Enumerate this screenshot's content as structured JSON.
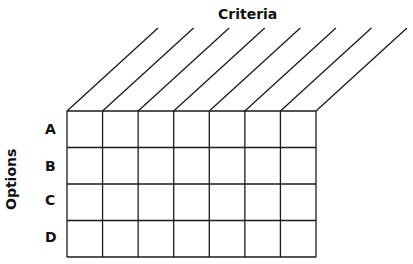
{
  "diagram": {
    "type": "decision-matrix-grid",
    "column_axis_label": "Criteria",
    "row_axis_label": "Options",
    "rows": [
      "A",
      "B",
      "C",
      "D"
    ],
    "criteria_columns": 7,
    "cells": [
      [
        "",
        "",
        "",
        "",
        "",
        "",
        ""
      ],
      [
        "",
        "",
        "",
        "",
        "",
        "",
        ""
      ],
      [
        "",
        "",
        "",
        "",
        "",
        "",
        ""
      ],
      [
        "",
        "",
        "",
        "",
        "",
        "",
        ""
      ]
    ],
    "line_color": "#1a1a1a"
  }
}
